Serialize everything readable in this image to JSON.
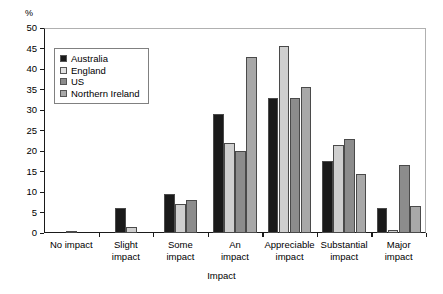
{
  "chart_data": {
    "type": "bar",
    "title": "",
    "subtitle": "",
    "xlabel": "Impact",
    "ylabel": "%",
    "ylim": [
      0,
      50
    ],
    "ytick_step": 5,
    "yticks": [
      0,
      5,
      10,
      15,
      20,
      25,
      30,
      35,
      40,
      45,
      50
    ],
    "ytick_labels": [
      "0",
      "5",
      "10",
      "15",
      "20",
      "25",
      "30",
      "35",
      "40",
      "45",
      "50"
    ],
    "grid": false,
    "legend_position": "upper left (inside plot)",
    "categories": [
      "No impact",
      "Slight\nimpact",
      "Some\nimpact",
      "An\nimpact",
      "Appreciable\nimpact",
      "Substantial\nimpact",
      "Major\nimpact"
    ],
    "series": [
      {
        "name": "Australia",
        "color": "#1a1a1a",
        "values": [
          0.4,
          6.0,
          9.5,
          29.0,
          33.0,
          17.5,
          6.0
        ]
      },
      {
        "name": "England",
        "color": "#cfcfcf",
        "values": [
          null,
          1.5,
          7.0,
          22.0,
          45.5,
          21.5,
          0.7
        ]
      },
      {
        "name": "US",
        "color": "#8c8c8c",
        "values": [
          null,
          null,
          8.0,
          20.0,
          33.0,
          23.0,
          16.5
        ]
      },
      {
        "name": "Northern Ireland",
        "color": "#a8a8a8",
        "values": [
          null,
          null,
          null,
          43.0,
          35.5,
          14.5,
          6.5
        ]
      }
    ]
  },
  "legend": {
    "items": [
      {
        "label": "Australia",
        "color": "#1a1a1a"
      },
      {
        "label": "England",
        "color": "#e2e2e2"
      },
      {
        "label": "US",
        "color": "#8c8c8c"
      },
      {
        "label": "Northern Ireland",
        "color": "#a8a8a8"
      }
    ]
  },
  "axes": {
    "y_unit_label": "%",
    "x_title": "Impact"
  }
}
